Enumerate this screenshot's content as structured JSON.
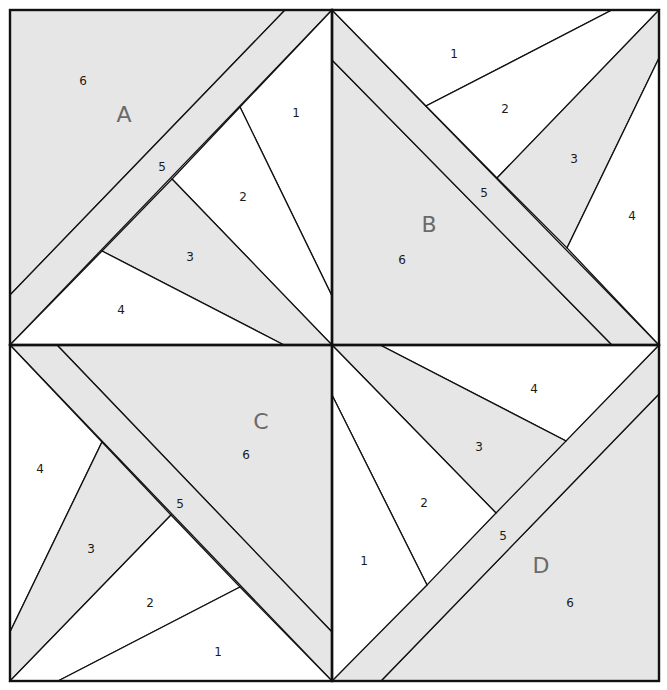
{
  "colors": {
    "shaded_fabric": "#e6e6e6",
    "light_fabric": "#ffffff",
    "seam_line": "#111111",
    "block_label": "#6a6a6a"
  },
  "blocks": [
    {
      "label": "A",
      "pieces": [
        {
          "number": "1",
          "fabric": "light"
        },
        {
          "number": "2",
          "fabric": "light"
        },
        {
          "number": "3",
          "fabric": "shaded"
        },
        {
          "number": "4",
          "fabric": "light"
        },
        {
          "number": "5",
          "fabric": "shaded"
        },
        {
          "number": "6",
          "fabric": "shaded"
        }
      ]
    },
    {
      "label": "B",
      "pieces": [
        {
          "number": "1",
          "fabric": "light"
        },
        {
          "number": "2",
          "fabric": "light"
        },
        {
          "number": "3",
          "fabric": "shaded"
        },
        {
          "number": "4",
          "fabric": "light"
        },
        {
          "number": "5",
          "fabric": "shaded"
        },
        {
          "number": "6",
          "fabric": "shaded"
        }
      ]
    },
    {
      "label": "C",
      "pieces": [
        {
          "number": "1",
          "fabric": "light"
        },
        {
          "number": "2",
          "fabric": "light"
        },
        {
          "number": "3",
          "fabric": "shaded"
        },
        {
          "number": "4",
          "fabric": "light"
        },
        {
          "number": "5",
          "fabric": "shaded"
        },
        {
          "number": "6",
          "fabric": "shaded"
        }
      ]
    },
    {
      "label": "D",
      "pieces": [
        {
          "number": "1",
          "fabric": "light"
        },
        {
          "number": "2",
          "fabric": "light"
        },
        {
          "number": "3",
          "fabric": "shaded"
        },
        {
          "number": "4",
          "fabric": "light"
        },
        {
          "number": "5",
          "fabric": "shaded"
        },
        {
          "number": "6",
          "fabric": "shaded"
        }
      ]
    }
  ]
}
